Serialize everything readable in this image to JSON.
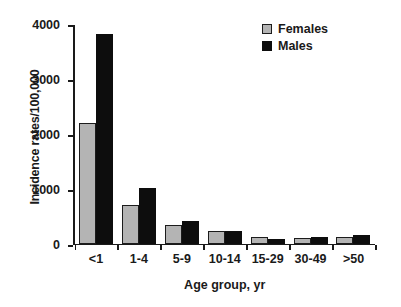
{
  "chart_data": {
    "type": "bar",
    "title": "",
    "xlabel": "Age group, yr",
    "ylabel": "Incidence rates/100,000",
    "categories": [
      "<1",
      "1-4",
      "5-9",
      "10-14",
      "15-29",
      "30-49",
      ">50"
    ],
    "series": [
      {
        "name": "Females",
        "color": "#b4b4b4",
        "values": [
          2200,
          710,
          330,
          230,
          120,
          110,
          120
        ]
      },
      {
        "name": "Males",
        "color": "#0d0d0d",
        "values": [
          3830,
          1020,
          420,
          230,
          80,
          120,
          160
        ]
      }
    ],
    "ylim": [
      0,
      4000
    ],
    "yticks": [
      0,
      1000,
      2000,
      3000,
      4000
    ],
    "ytick_labels": [
      "0",
      "1000",
      "2000",
      "3000",
      "4000"
    ],
    "grid": false,
    "legend_position": "top-right",
    "legend": [
      "Females",
      "Males"
    ]
  }
}
